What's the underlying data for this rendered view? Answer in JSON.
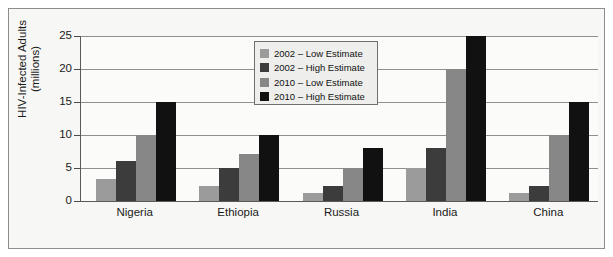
{
  "chart_data": {
    "type": "bar",
    "title": "",
    "subtitle": "",
    "xlabel": "",
    "ylabel": "HIV-Infected Adults\n(millions)",
    "categories": [
      "Nigeria",
      "Ethiopia",
      "Russia",
      "India",
      "China"
    ],
    "series": [
      {
        "name": "2002 – Low Estimate",
        "color": "#9b9b9b",
        "values": [
          3.3,
          2.2,
          1.2,
          5,
          1.2
        ]
      },
      {
        "name": "2002 – High Estimate",
        "color": "#3c3c3c",
        "values": [
          6,
          5,
          2.2,
          8,
          2.2
        ]
      },
      {
        "name": "2010 – Low Estimate",
        "color": "#878787",
        "values": [
          10,
          7.1,
          5,
          20,
          10
        ]
      },
      {
        "name": "2010 – High Estimate",
        "color": "#111111",
        "values": [
          15,
          10,
          8,
          25,
          15
        ]
      }
    ],
    "ylim": [
      0,
      25
    ],
    "yticks": [
      0,
      5,
      10,
      15,
      20,
      25
    ],
    "ytick_labels": [
      "0",
      "5",
      "10",
      "15",
      "20",
      "25"
    ],
    "grid": true,
    "grid_axis": "y",
    "legend_position": "upper center",
    "legend_entries": [
      "2002 – Low Estimate",
      "2002 – High Estimate",
      "2010 – Low Estimate",
      "2010 – High Estimate"
    ]
  },
  "figure": {
    "background_color": "#f7f7f5",
    "plot_background_color": "#fbfbfa",
    "border_color": "#8d8d8d",
    "axis_color": "#5a5a5a",
    "grid_color": "#8f8f8f",
    "text_color": "#1a1a1a"
  }
}
